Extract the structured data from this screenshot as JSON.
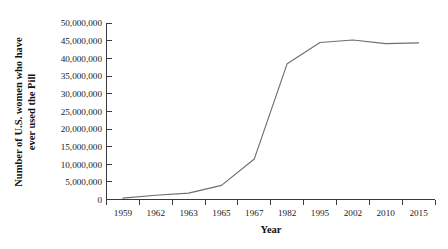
{
  "chart_data": {
    "type": "line",
    "title": "",
    "xlabel": "Year",
    "ylabel": "Number of U.S. women who have ever used the Pill",
    "ylabel_line1": "Number of U.S. women who have",
    "ylabel_line2": "ever used the Pill",
    "categories": [
      "1959",
      "1962",
      "1963",
      "1965",
      "1967",
      "1982",
      "1995",
      "2002",
      "2010",
      "2015"
    ],
    "values": [
      400000,
      1200000,
      1800000,
      4000000,
      11500000,
      38500000,
      44500000,
      45200000,
      44200000,
      44400000
    ],
    "series": [
      {
        "name": "U.S. women who have ever used the Pill",
        "values": [
          400000,
          1200000,
          1800000,
          4000000,
          11500000,
          38500000,
          44500000,
          45200000,
          44200000,
          44400000
        ]
      }
    ],
    "ylim": [
      0,
      50000000
    ],
    "ytick_values": [
      0,
      5000000,
      10000000,
      15000000,
      20000000,
      25000000,
      30000000,
      35000000,
      40000000,
      45000000,
      50000000
    ],
    "ytick_labels": [
      "0",
      "5,000,000",
      "10,000,000",
      "15,000,000",
      "20,000,000",
      "25,000,000",
      "30,000,000",
      "35,000,000",
      "40,000,000",
      "45,000,000",
      "50,000,000"
    ],
    "xtick_labels": [
      "1959",
      "1962",
      "1963",
      "1965",
      "1967",
      "1982",
      "1995",
      "2002",
      "2010",
      "2015"
    ],
    "grid": false,
    "legend": false,
    "legend_position": "none",
    "line_color": "#6e6e6e",
    "axis_color": "#3a3a3a",
    "background_color": "#ffffff"
  }
}
